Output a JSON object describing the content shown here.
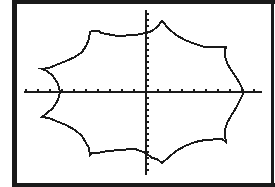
{
  "screen": {
    "background": "#ffffff",
    "frame_color": "#1a1a1a",
    "curve_color": "#1a1a1a",
    "axis_color": "#1a1a1a"
  },
  "chart_data": {
    "type": "line",
    "title": "",
    "xlabel": "",
    "ylabel": "",
    "grid": false,
    "legend": null,
    "axes": {
      "x_axis_pixel_y": 92,
      "x_axis_pixel_range": [
        24,
        262
      ],
      "x_tick_spacing_px": 12,
      "y_axis_pixel_x": 146,
      "y_axis_pixel_range": [
        10,
        175
      ],
      "y_tick_spacing_px": 6
    },
    "series": [
      {
        "name": "closed-curve",
        "closed": true,
        "points_px": [
          [
            244,
            92
          ],
          [
            240,
            84
          ],
          [
            236,
            77
          ],
          [
            231,
            70
          ],
          [
            227,
            63
          ],
          [
            225,
            56
          ],
          [
            225,
            50
          ],
          [
            226,
            47
          ],
          [
            222,
            47
          ],
          [
            205,
            47
          ],
          [
            195,
            44
          ],
          [
            185,
            40
          ],
          [
            176,
            35
          ],
          [
            169,
            29
          ],
          [
            162,
            21
          ],
          [
            157,
            27
          ],
          [
            152,
            31
          ],
          [
            146,
            33
          ],
          [
            135,
            35
          ],
          [
            118,
            36
          ],
          [
            101,
            33
          ],
          [
            99,
            31
          ],
          [
            92,
            31
          ],
          [
            90,
            32
          ],
          [
            89,
            39
          ],
          [
            86,
            46
          ],
          [
            82,
            52
          ],
          [
            75,
            57
          ],
          [
            66,
            61
          ],
          [
            56,
            65
          ],
          [
            49,
            68
          ],
          [
            42,
            69
          ],
          [
            47,
            71
          ],
          [
            53,
            76
          ],
          [
            58,
            84
          ],
          [
            60,
            92
          ],
          [
            58,
            100
          ],
          [
            53,
            108
          ],
          [
            47,
            113
          ],
          [
            42,
            117
          ],
          [
            49,
            118
          ],
          [
            56,
            121
          ],
          [
            66,
            125
          ],
          [
            75,
            130
          ],
          [
            82,
            136
          ],
          [
            86,
            143
          ],
          [
            89,
            148
          ],
          [
            90,
            155
          ],
          [
            92,
            153
          ],
          [
            99,
            153
          ],
          [
            101,
            152
          ],
          [
            118,
            150
          ],
          [
            135,
            149
          ],
          [
            146,
            153
          ],
          [
            152,
            158
          ],
          [
            157,
            159
          ],
          [
            162,
            163
          ],
          [
            169,
            157
          ],
          [
            176,
            151
          ],
          [
            185,
            146
          ],
          [
            195,
            142
          ],
          [
            205,
            140
          ],
          [
            222,
            139
          ],
          [
            226,
            142
          ],
          [
            225,
            136
          ],
          [
            225,
            130
          ],
          [
            227,
            123
          ],
          [
            231,
            116
          ],
          [
            236,
            108
          ],
          [
            240,
            100
          ],
          [
            244,
            92
          ]
        ]
      }
    ]
  }
}
